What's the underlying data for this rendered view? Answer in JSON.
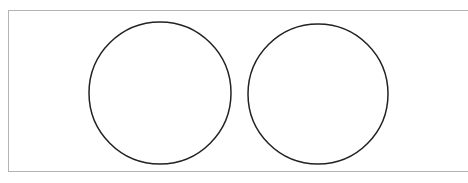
{
  "diagram": {
    "frame": {
      "border_color": "#b3b3b3",
      "background": "#ffffff"
    },
    "shapes": [
      {
        "type": "circle",
        "cx": 160,
        "cy": 93,
        "r": 71,
        "stroke": "#222222",
        "fill": "none"
      },
      {
        "type": "circle",
        "cx": 318,
        "cy": 94,
        "r": 70,
        "stroke": "#222222",
        "fill": "none"
      }
    ]
  }
}
